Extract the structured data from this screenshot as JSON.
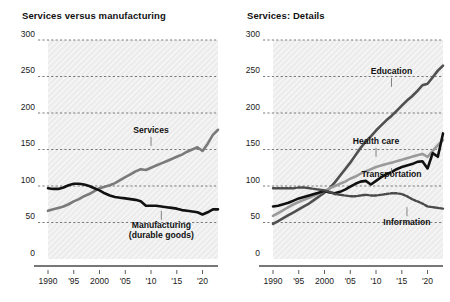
{
  "figure": {
    "width": 450,
    "height": 302,
    "background": "#ffffff",
    "plot_background": "#ececec",
    "hatch": "diagonal-light"
  },
  "panels": [
    {
      "id": "services-versus-manufacturing",
      "title": "Services versus manufacturing"
    },
    {
      "id": "services-details",
      "title": "Services: Details"
    }
  ],
  "chart_data": [
    {
      "type": "line",
      "title": "Services versus manufacturing",
      "xlabel": "",
      "ylabel": "",
      "xlim": [
        1990,
        2023
      ],
      "ylim": [
        0,
        300
      ],
      "yticks": [
        0,
        50,
        100,
        150,
        200,
        250,
        300
      ],
      "ytick_labels": [
        "0",
        "50",
        "100",
        "150",
        "200",
        "250",
        "300"
      ],
      "xticks": [
        1990,
        1995,
        2000,
        2005,
        2010,
        2015,
        2020
      ],
      "xtick_labels": [
        "1990",
        "'95",
        "2000",
        "'05",
        "'10",
        "'15",
        "'20"
      ],
      "grid": "horizontal-dashed",
      "legend": "inline-annotations",
      "x": [
        1990,
        1991,
        1992,
        1993,
        1994,
        1995,
        1996,
        1997,
        1998,
        1999,
        2000,
        2001,
        2002,
        2003,
        2004,
        2005,
        2006,
        2007,
        2008,
        2009,
        2010,
        2011,
        2012,
        2013,
        2014,
        2015,
        2016,
        2017,
        2018,
        2019,
        2020,
        2021,
        2022,
        2023
      ],
      "series": [
        {
          "name": "Services",
          "color": "#7a7a7a",
          "style": "solid",
          "label_text": "Services",
          "label_x": 2010,
          "label_y": 172,
          "values": [
            66,
            68,
            70,
            72,
            75,
            79,
            82,
            86,
            89,
            93,
            97,
            99,
            101,
            104,
            108,
            112,
            116,
            120,
            123,
            122,
            125,
            128,
            131,
            134,
            137,
            140,
            143,
            147,
            150,
            153,
            148,
            158,
            170,
            177
          ]
        },
        {
          "name": "Manufacturing (durable goods)",
          "color": "#111111",
          "style": "solid",
          "label_text": "Manufacturing\n(durable goods)",
          "label_x": 2012,
          "label_y": 42,
          "values": [
            97,
            96,
            96,
            98,
            101,
            103,
            103,
            102,
            100,
            97,
            94,
            90,
            87,
            85,
            84,
            83,
            82,
            81,
            79,
            73,
            73,
            73,
            72,
            71,
            70,
            69,
            67,
            66,
            65,
            64,
            61,
            64,
            68,
            68
          ]
        }
      ]
    },
    {
      "type": "line",
      "title": "Services: Details",
      "xlabel": "",
      "ylabel": "",
      "xlim": [
        1990,
        2023
      ],
      "ylim": [
        0,
        300
      ],
      "yticks": [
        0,
        50,
        100,
        150,
        200,
        250,
        300
      ],
      "ytick_labels": [
        "0",
        "50",
        "100",
        "150",
        "200",
        "250",
        "300"
      ],
      "xticks": [
        1990,
        1995,
        2000,
        2005,
        2010,
        2015,
        2020
      ],
      "xtick_labels": [
        "1990",
        "'95",
        "2000",
        "'05",
        "'10",
        "'15",
        "'20"
      ],
      "grid": "horizontal-dashed",
      "legend": "inline-annotations",
      "x": [
        1990,
        1991,
        1992,
        1993,
        1994,
        1995,
        1996,
        1997,
        1998,
        1999,
        2000,
        2001,
        2002,
        2003,
        2004,
        2005,
        2006,
        2007,
        2008,
        2009,
        2010,
        2011,
        2012,
        2013,
        2014,
        2015,
        2016,
        2017,
        2018,
        2019,
        2020,
        2021,
        2022,
        2023
      ],
      "series": [
        {
          "name": "Education",
          "color": "#4f4f4f",
          "style": "solid",
          "label_text": "Education",
          "label_x": 2013,
          "label_y": 253,
          "values": [
            48,
            52,
            56,
            60,
            64,
            68,
            72,
            76,
            81,
            86,
            91,
            97,
            105,
            114,
            123,
            132,
            142,
            152,
            161,
            168,
            176,
            183,
            190,
            196,
            203,
            210,
            217,
            223,
            230,
            238,
            240,
            249,
            258,
            265
          ]
        },
        {
          "name": "Health care",
          "color": "#9a9a9a",
          "style": "solid",
          "label_text": "Health care",
          "label_x": 2010,
          "label_y": 157,
          "values": [
            59,
            63,
            67,
            71,
            75,
            78,
            81,
            84,
            87,
            90,
            93,
            97,
            100,
            103,
            106,
            110,
            113,
            117,
            120,
            123,
            126,
            128,
            130,
            132,
            134,
            136,
            138,
            140,
            142,
            144,
            140,
            148,
            156,
            163
          ]
        },
        {
          "name": "Transportation",
          "color": "#111111",
          "style": "solid",
          "label_text": "Transportation",
          "label_x": 2013,
          "label_y": 113,
          "values": [
            72,
            73,
            75,
            77,
            80,
            83,
            85,
            87,
            89,
            91,
            93,
            91,
            90,
            92,
            95,
            99,
            103,
            106,
            107,
            102,
            107,
            112,
            116,
            119,
            123,
            126,
            128,
            130,
            133,
            134,
            124,
            145,
            140,
            172
          ]
        },
        {
          "name": "Information",
          "color": "#4a4a4a",
          "style": "dotted",
          "label_text": "Information",
          "label_x": 2016,
          "label_y": 47,
          "values": [
            97,
            97,
            97,
            97,
            97,
            98,
            98,
            97,
            96,
            95,
            94,
            92,
            89,
            88,
            87,
            86,
            86,
            87,
            88,
            87,
            87,
            88,
            89,
            90,
            90,
            89,
            86,
            82,
            79,
            76,
            72,
            71,
            70,
            69
          ]
        }
      ]
    }
  ]
}
